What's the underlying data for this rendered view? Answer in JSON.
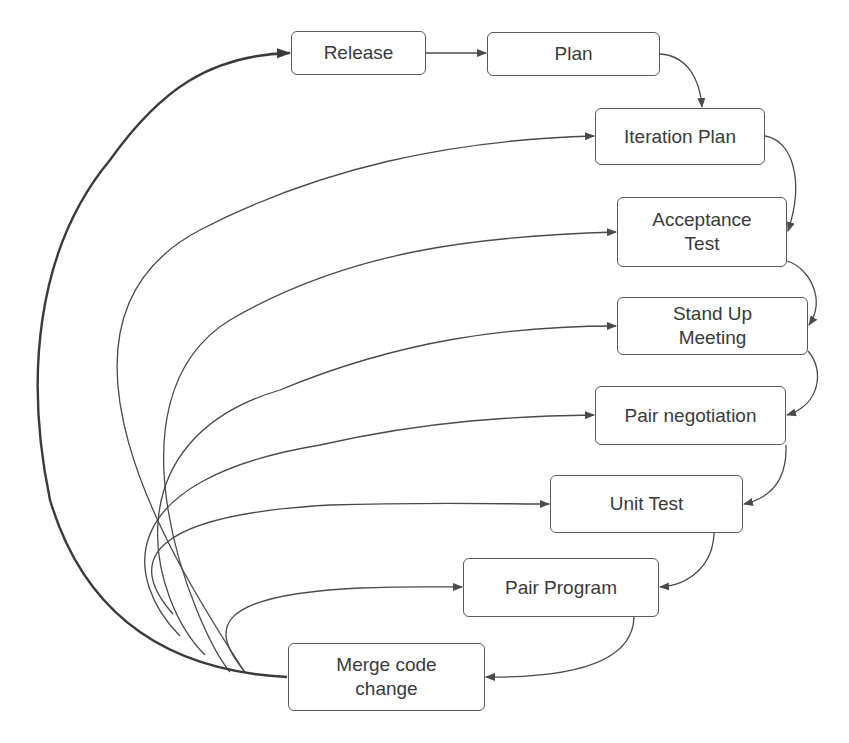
{
  "diagram": {
    "type": "flow",
    "colors": {
      "stroke": "#4a4a4a",
      "text": "#3a3a3a",
      "background": "#ffffff"
    },
    "nodes": [
      {
        "id": "release",
        "label": "Release"
      },
      {
        "id": "plan",
        "label": "Plan"
      },
      {
        "id": "iteration_plan",
        "label": "Iteration Plan"
      },
      {
        "id": "acceptance_test",
        "label": "Acceptance Test",
        "line1": "Acceptance",
        "line2": "Test"
      },
      {
        "id": "stand_up",
        "label": "Stand Up Meeting",
        "line1": "Stand Up",
        "line2": "Meeting"
      },
      {
        "id": "pair_negotiation",
        "label": "Pair negotiation"
      },
      {
        "id": "unit_test",
        "label": "Unit Test"
      },
      {
        "id": "pair_program",
        "label": "Pair Program"
      },
      {
        "id": "merge",
        "label": "Merge code change",
        "line1": "Merge code",
        "line2": "change"
      }
    ],
    "edges": [
      {
        "from": "release",
        "to": "plan"
      },
      {
        "from": "plan",
        "to": "iteration_plan"
      },
      {
        "from": "iteration_plan",
        "to": "acceptance_test"
      },
      {
        "from": "acceptance_test",
        "to": "stand_up"
      },
      {
        "from": "stand_up",
        "to": "pair_negotiation"
      },
      {
        "from": "pair_negotiation",
        "to": "unit_test"
      },
      {
        "from": "unit_test",
        "to": "pair_program"
      },
      {
        "from": "pair_program",
        "to": "merge"
      },
      {
        "from": "merge",
        "to": "release",
        "emphasis": "bold"
      },
      {
        "from": "merge",
        "to": "iteration_plan"
      },
      {
        "from": "merge",
        "to": "acceptance_test"
      },
      {
        "from": "merge",
        "to": "stand_up"
      },
      {
        "from": "merge",
        "to": "pair_negotiation"
      },
      {
        "from": "merge",
        "to": "unit_test"
      },
      {
        "from": "merge",
        "to": "pair_program"
      }
    ]
  }
}
